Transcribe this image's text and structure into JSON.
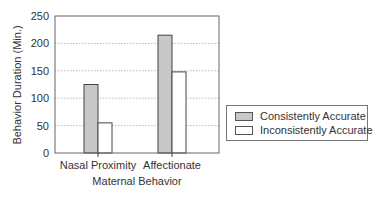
{
  "chart_data": {
    "type": "bar",
    "title": "",
    "xlabel": "Maternal Behavior",
    "ylabel": "Behavior Duration (Min.)",
    "categories": [
      "Nasal Proximity",
      "Affectionate"
    ],
    "series": [
      {
        "name": "Consistently Accurate",
        "values": [
          125,
          215
        ],
        "color": "#c8c8c8"
      },
      {
        "name": "Inconsistently Accurate",
        "values": [
          55,
          148
        ],
        "color": "#ffffff"
      }
    ],
    "ylim": [
      0,
      250
    ],
    "yticks": [
      0,
      50,
      100,
      150,
      200,
      250
    ],
    "grid": true,
    "legend_position": "right"
  },
  "legend": {
    "items": [
      {
        "label": "Consistently Accurate",
        "color": "#c8c8c8"
      },
      {
        "label": "Inconsistently Accurate",
        "color": "#ffffff"
      }
    ]
  }
}
